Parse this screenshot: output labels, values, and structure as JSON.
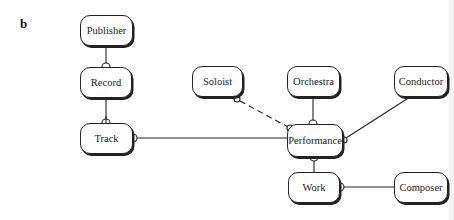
{
  "panel_label": "b",
  "entities": {
    "publisher": {
      "label": "Publisher",
      "x": 80,
      "y": 15,
      "w": 53,
      "h": 31
    },
    "record": {
      "label": "Record",
      "x": 80,
      "y": 67,
      "w": 52,
      "h": 31
    },
    "track": {
      "label": "Track",
      "x": 80,
      "y": 123,
      "w": 53,
      "h": 31
    },
    "soloist": {
      "label": "Soloist",
      "x": 192,
      "y": 66,
      "w": 51,
      "h": 31
    },
    "orchestra": {
      "label": "Orchestra",
      "x": 287,
      "y": 66,
      "w": 53,
      "h": 31
    },
    "conductor": {
      "label": "Conductor",
      "x": 394,
      "y": 66,
      "w": 54,
      "h": 31
    },
    "performance": {
      "label": "Performance",
      "x": 287,
      "y": 124,
      "w": 56,
      "h": 33
    },
    "work": {
      "label": "Work",
      "x": 288,
      "y": 172,
      "w": 52,
      "h": 31
    },
    "composer": {
      "label": "Composer",
      "x": 394,
      "y": 172,
      "w": 54,
      "h": 31
    }
  },
  "relationships": [
    {
      "from": "Publisher",
      "to": "Record",
      "style": "solid"
    },
    {
      "from": "Record",
      "to": "Track",
      "style": "solid"
    },
    {
      "from": "Track",
      "to": "Performance",
      "style": "solid"
    },
    {
      "from": "Soloist",
      "to": "Performance",
      "style": "dashed"
    },
    {
      "from": "Orchestra",
      "to": "Performance",
      "style": "solid"
    },
    {
      "from": "Conductor",
      "to": "Performance",
      "style": "solid"
    },
    {
      "from": "Performance",
      "to": "Work",
      "style": "solid"
    },
    {
      "from": "Composer",
      "to": "Work",
      "style": "solid"
    }
  ]
}
